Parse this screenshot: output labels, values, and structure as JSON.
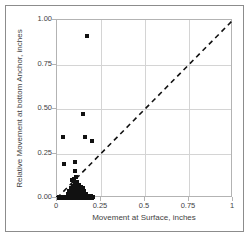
{
  "chart_data": {
    "type": "scatter",
    "title": "",
    "xlabel": "Movement at Surface, inches",
    "ylabel": "Relative Movement at bottom Anchor, inches",
    "xlim": [
      0,
      1
    ],
    "ylim": [
      0,
      1
    ],
    "grid": true,
    "legend": "none",
    "xticks": [
      "0",
      "0.25",
      "0.5",
      "0.75",
      "1"
    ],
    "xtick_values": [
      0,
      0.25,
      0.5,
      0.75,
      1
    ],
    "yticks": [
      "0.00",
      "0.25",
      "0.50",
      "0.75",
      "1.00"
    ],
    "ytick_values": [
      0,
      0.25,
      0.5,
      0.75,
      1
    ],
    "marker": {
      "shape": "square",
      "color": "#111111",
      "size_px": 4
    },
    "annotations": [
      {
        "name": "one-to-one-reference-line",
        "type": "line",
        "style": "dashed",
        "color": "#111111",
        "from": [
          0,
          0
        ],
        "to": [
          1,
          1
        ]
      }
    ],
    "series": [
      {
        "name": "Anchor movement measurements",
        "points": [
          [
            0.035,
            0.34
          ],
          [
            0.04,
            0.19
          ],
          [
            0.15,
            0.47
          ],
          [
            0.17,
            0.91
          ],
          [
            0.16,
            0.34
          ],
          [
            0.2,
            0.32
          ],
          [
            0.1,
            0.2
          ],
          [
            0.105,
            0.15
          ],
          [
            0.11,
            0.12
          ],
          [
            0.095,
            0.105
          ],
          [
            0.085,
            0.1
          ],
          [
            0.1,
            0.085
          ],
          [
            0.115,
            0.09
          ],
          [
            0.125,
            0.075
          ],
          [
            0.09,
            0.07
          ],
          [
            0.105,
            0.065
          ],
          [
            0.12,
            0.06
          ],
          [
            0.135,
            0.06
          ],
          [
            0.145,
            0.055
          ],
          [
            0.08,
            0.055
          ],
          [
            0.095,
            0.05
          ],
          [
            0.11,
            0.045
          ],
          [
            0.125,
            0.045
          ],
          [
            0.14,
            0.04
          ],
          [
            0.155,
            0.04
          ],
          [
            0.07,
            0.04
          ],
          [
            0.085,
            0.035
          ],
          [
            0.1,
            0.03
          ],
          [
            0.115,
            0.03
          ],
          [
            0.13,
            0.025
          ],
          [
            0.15,
            0.025
          ],
          [
            0.165,
            0.02
          ],
          [
            0.06,
            0.025
          ],
          [
            0.075,
            0.02
          ],
          [
            0.09,
            0.018
          ],
          [
            0.105,
            0.015
          ],
          [
            0.12,
            0.012
          ],
          [
            0.135,
            0.012
          ],
          [
            0.16,
            0.01
          ],
          [
            0.18,
            0.01
          ],
          [
            0.195,
            0.01
          ],
          [
            0.205,
            0.008
          ],
          [
            0.01,
            0.005
          ],
          [
            0.02,
            0.005
          ],
          [
            0.03,
            0.005
          ],
          [
            0.04,
            0.004
          ],
          [
            0.05,
            0.004
          ],
          [
            0.06,
            0.004
          ],
          [
            0.07,
            0.003
          ],
          [
            0.08,
            0.003
          ],
          [
            0.09,
            0.003
          ],
          [
            0.1,
            0.003
          ],
          [
            0.11,
            0.002
          ],
          [
            0.12,
            0.002
          ],
          [
            0.13,
            0.002
          ],
          [
            0.14,
            0.002
          ],
          [
            0.15,
            0.002
          ],
          [
            0.16,
            0.002
          ],
          [
            0.17,
            0.002
          ],
          [
            0.185,
            0.002
          ],
          [
            0.2,
            0.002
          ],
          [
            0.005,
            0.002
          ],
          [
            0.015,
            0.002
          ],
          [
            0.025,
            0.002
          ],
          [
            0.035,
            0.002
          ],
          [
            0.045,
            0.002
          ],
          [
            0.055,
            0.002
          ],
          [
            0.065,
            0.002
          ],
          [
            0.075,
            0.002
          ],
          [
            0.085,
            0.002
          ],
          [
            0.095,
            0.002
          ]
        ]
      }
    ]
  }
}
